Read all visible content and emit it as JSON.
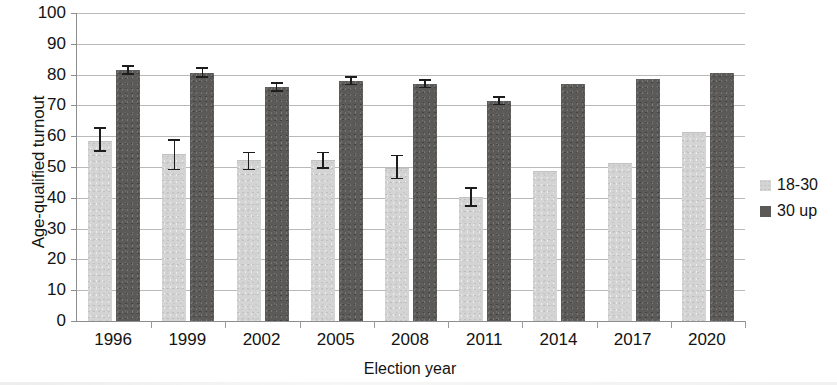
{
  "chart_data": {
    "type": "bar",
    "title": "",
    "xlabel": "Election year",
    "ylabel": "Age-qualified turnout",
    "categories": [
      "1996",
      "1999",
      "2002",
      "2005",
      "2008",
      "2011",
      "2014",
      "2017",
      "2020"
    ],
    "ylim": [
      0,
      100
    ],
    "yticks": [
      0,
      10,
      20,
      30,
      40,
      50,
      60,
      70,
      80,
      90,
      100
    ],
    "grid": true,
    "legend_position": "right",
    "series": [
      {
        "name": "18-30",
        "color": "#d4d4d4",
        "values": [
          58,
          54,
          52,
          52,
          49.5,
          40,
          48.5,
          51,
          61
        ],
        "error_low": [
          55,
          49,
          49,
          49.5,
          46,
          37,
          null,
          null,
          null
        ],
        "error_high": [
          63,
          59,
          55,
          55,
          54,
          43.5,
          null,
          null,
          null
        ]
      },
      {
        "name": "30 up",
        "color": "#5b5a58",
        "values": [
          81.5,
          80.5,
          76,
          78,
          77,
          71.5,
          77,
          78.5,
          80.5
        ],
        "error_low": [
          80,
          79,
          74.5,
          76.5,
          75.5,
          70,
          null,
          null,
          null
        ],
        "error_high": [
          83,
          82.5,
          77.5,
          79.5,
          78.5,
          73,
          null,
          null,
          null
        ]
      }
    ]
  },
  "axes": {
    "y_title": "Age-qualified turnout",
    "x_title": "Election year",
    "y_tick_labels": [
      "100",
      "90",
      "80",
      "70",
      "60",
      "50",
      "40",
      "30",
      "20",
      "10",
      "0"
    ],
    "x_tick_labels": [
      "1996",
      "1999",
      "2002",
      "2005",
      "2008",
      "2011",
      "2014",
      "2017",
      "2020"
    ]
  },
  "legend": {
    "items": [
      {
        "label": "18-30",
        "swatch": "light-gray-swatch"
      },
      {
        "label": "30 up",
        "swatch": "dark-gray-swatch"
      }
    ]
  }
}
